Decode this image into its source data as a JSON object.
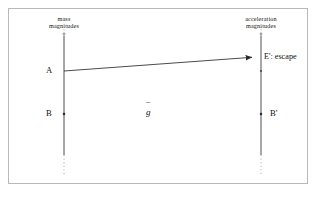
{
  "figure": {
    "kind": "mathematical-diagram",
    "background_color": "#ffffff",
    "ink_color": "#2a2a2a",
    "border_color": "#b9b9b9",
    "width": 317,
    "height": 201
  },
  "axes": {
    "left": {
      "caption_line1": "mass",
      "caption_line2": "magnitudes",
      "x": 64,
      "top_y": 34,
      "bottom_y": 168
    },
    "right": {
      "caption_line1": "acceleration",
      "caption_line2": "magnitudes",
      "x": 261,
      "top_y": 34,
      "bottom_y": 168
    }
  },
  "points": [
    {
      "id": "A",
      "label": "A",
      "axis": "left",
      "x": 64,
      "y": 71
    },
    {
      "id": "B",
      "label": "B",
      "axis": "left",
      "x": 64,
      "y": 114
    },
    {
      "id": "Ep",
      "label": "E': escape",
      "axis": "right",
      "x": 261,
      "y": 57
    },
    {
      "id": "Bp",
      "label": "B'",
      "axis": "right",
      "x": 261,
      "y": 114
    }
  ],
  "arrow": {
    "label": "g",
    "accent": "¯",
    "from_point": "A",
    "to_point": "Ep",
    "x1": 64,
    "y1": 71,
    "x2": 259,
    "y2": 57
  },
  "map_label": {
    "symbol": "g",
    "accent": "¯",
    "x": 150,
    "y": 112
  }
}
